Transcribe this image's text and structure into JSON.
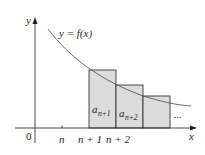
{
  "diagram": {
    "type": "series-integral-test",
    "curve_label": "y = f(x)",
    "axis_labels": {
      "x": "x",
      "y": "y",
      "origin": "0"
    },
    "x_ticks": [
      "n",
      "n + 1",
      "n + 2"
    ],
    "rectangles": [
      {
        "label_base": "a",
        "label_sub": "n+1"
      },
      {
        "label_base": "a",
        "label_sub": "n+2"
      },
      {
        "label_base": "",
        "label_sub": ""
      }
    ],
    "continuation": "...",
    "colors": {
      "rect_fill": "#dcdcdc",
      "line": "#231f20",
      "curve": "#58595b"
    }
  }
}
